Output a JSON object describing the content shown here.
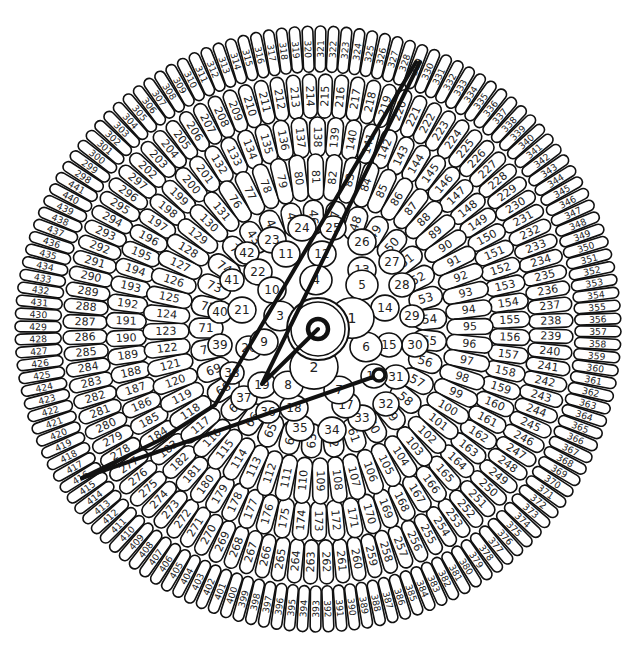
{
  "diagram": {
    "center": {
      "x": 318,
      "y": 329
    },
    "stroke_color": "#111111",
    "fill_color": "#ffffff",
    "text_color": "#222222",
    "inner_florets": [
      {
        "n": 1,
        "x": 352,
        "y": 318,
        "r": 22
      },
      {
        "n": 2,
        "x": 314,
        "y": 367,
        "r": 24
      },
      {
        "n": 3,
        "x": 280,
        "y": 316,
        "r": 16
      },
      {
        "n": 4,
        "x": 316,
        "y": 280,
        "r": 16
      },
      {
        "n": 5,
        "x": 362,
        "y": 285,
        "r": 16
      },
      {
        "n": 6,
        "x": 366,
        "y": 347,
        "r": 16
      },
      {
        "n": 7,
        "x": 339,
        "y": 390,
        "r": 15
      },
      {
        "n": 8,
        "x": 288,
        "y": 385,
        "r": 15
      },
      {
        "n": 9,
        "x": 264,
        "y": 342,
        "r": 14
      },
      {
        "n": 10,
        "x": 272,
        "y": 290,
        "r": 14
      },
      {
        "n": 11,
        "x": 286,
        "y": 254,
        "r": 14
      },
      {
        "n": 12,
        "x": 322,
        "y": 254,
        "r": 14
      },
      {
        "n": 13,
        "x": 362,
        "y": 270,
        "r": 14
      },
      {
        "n": 14,
        "x": 385,
        "y": 308,
        "r": 14
      },
      {
        "n": 15,
        "x": 389,
        "y": 345,
        "r": 13
      },
      {
        "n": 16,
        "x": 374,
        "y": 376,
        "r": 13
      },
      {
        "n": 17,
        "x": 346,
        "y": 405,
        "r": 14
      },
      {
        "n": 18,
        "x": 294,
        "y": 408,
        "r": 14
      },
      {
        "n": 19,
        "x": 262,
        "y": 385,
        "r": 14
      },
      {
        "n": 20,
        "x": 249,
        "y": 348,
        "r": 13
      },
      {
        "n": 21,
        "x": 242,
        "y": 310,
        "r": 14
      },
      {
        "n": 22,
        "x": 258,
        "y": 272,
        "r": 14
      },
      {
        "n": 23,
        "x": 272,
        "y": 240,
        "r": 14
      },
      {
        "n": 24,
        "x": 302,
        "y": 228,
        "r": 14
      },
      {
        "n": 25,
        "x": 333,
        "y": 228,
        "r": 13
      },
      {
        "n": 26,
        "x": 362,
        "y": 242,
        "r": 14
      },
      {
        "n": 27,
        "x": 392,
        "y": 262,
        "r": 13
      },
      {
        "n": 28,
        "x": 402,
        "y": 285,
        "r": 13
      },
      {
        "n": 29,
        "x": 412,
        "y": 316,
        "r": 12
      },
      {
        "n": 30,
        "x": 415,
        "y": 345,
        "r": 13
      },
      {
        "n": 31,
        "x": 396,
        "y": 377,
        "r": 13
      },
      {
        "n": 32,
        "x": 386,
        "y": 404,
        "r": 13
      },
      {
        "n": 33,
        "x": 362,
        "y": 418,
        "r": 14
      },
      {
        "n": 34,
        "x": 332,
        "y": 430,
        "r": 14
      },
      {
        "n": 35,
        "x": 300,
        "y": 428,
        "r": 14
      },
      {
        "n": 36,
        "x": 268,
        "y": 412,
        "r": 12
      },
      {
        "n": 37,
        "x": 244,
        "y": 398,
        "r": 13
      },
      {
        "n": 38,
        "x": 232,
        "y": 373,
        "r": 12
      },
      {
        "n": 39,
        "x": 220,
        "y": 345,
        "r": 12
      },
      {
        "n": 40,
        "x": 220,
        "y": 312,
        "r": 12
      },
      {
        "n": 41,
        "x": 232,
        "y": 280,
        "r": 12
      },
      {
        "n": 42,
        "x": 247,
        "y": 253,
        "r": 12
      }
    ],
    "rings": [
      {
        "from": 43,
        "to": 75,
        "radius": 112,
        "start_deg": -35,
        "w": 34,
        "h": 28,
        "font": 12
      },
      {
        "from": 76,
        "to": 131,
        "radius": 152,
        "start_deg": -33,
        "w": 46,
        "h": 20,
        "font": 11
      },
      {
        "from": 132,
        "to": 201,
        "radius": 192,
        "start_deg": -31,
        "w": 40,
        "h": 17,
        "font": 11
      },
      {
        "from": 202,
        "to": 297,
        "radius": 233,
        "start_deg": -47,
        "w": 44,
        "h": 14.5,
        "font": 11
      },
      {
        "from": 298,
        "to": 441,
        "radius": 280,
        "start_deg": -57,
        "w": 46,
        "h": 11.5,
        "font": 10
      }
    ],
    "center_mark": {
      "outer_ring_r": 31,
      "inner_ring_r": 27,
      "dot_r": 10
    },
    "small_circle": {
      "x": 379,
      "y": 375,
      "r": 6
    },
    "paths": [
      {
        "name": "center-to-19-to-top",
        "points": [
          [
            318,
            329
          ],
          [
            262,
            384
          ],
          [
            420,
            62
          ]
        ]
      },
      {
        "name": "top-to-410",
        "points": [
          [
            416,
            62
          ],
          [
            250,
            345
          ],
          [
            215,
            405
          ],
          [
            160,
            440
          ],
          [
            82,
            478
          ]
        ]
      },
      {
        "name": "410-to-small-circle",
        "points": [
          [
            82,
            478
          ],
          [
            379,
            375
          ]
        ]
      }
    ]
  }
}
